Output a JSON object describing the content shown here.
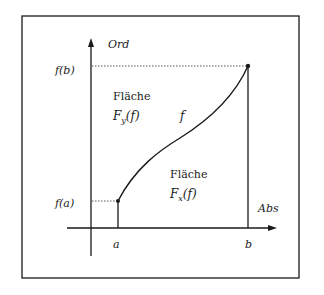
{
  "diagram": {
    "axes": {
      "y_label": "Ord",
      "x_label": "Abs"
    },
    "ticks": {
      "a": "a",
      "b": "b",
      "fa": "f(a)",
      "fb": "f(b)"
    },
    "curve_label": "f",
    "areas": {
      "upper": {
        "title": "Fläche",
        "formula_base": "F",
        "formula_sub": "y",
        "formula_arg": "(f)"
      },
      "lower": {
        "title": "Fläche",
        "formula_base": "F",
        "formula_sub": "x",
        "formula_arg": "(f)"
      }
    },
    "colors": {
      "stroke": "#1a1a1a",
      "background": "#ffffff"
    }
  }
}
